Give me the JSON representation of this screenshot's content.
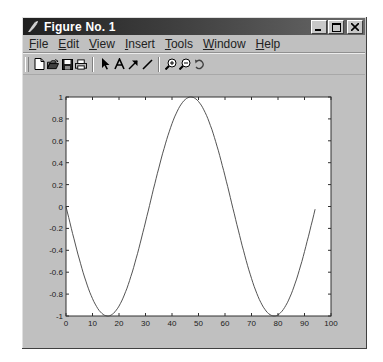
{
  "window": {
    "title": "Figure No. 1",
    "controls": {
      "minimize": "_",
      "maximize": "□",
      "close": "X"
    }
  },
  "menubar": {
    "items": [
      {
        "label": "File",
        "mnemonic": "F"
      },
      {
        "label": "Edit",
        "mnemonic": "E"
      },
      {
        "label": "View",
        "mnemonic": "V"
      },
      {
        "label": "Insert",
        "mnemonic": "I"
      },
      {
        "label": "Tools",
        "mnemonic": "T"
      },
      {
        "label": "Window",
        "mnemonic": "W"
      },
      {
        "label": "Help",
        "mnemonic": "H"
      }
    ]
  },
  "toolbar": {
    "groups": [
      [
        "new-file-icon",
        "open-file-icon",
        "save-icon",
        "print-icon"
      ],
      [
        "select-arrow-icon",
        "insert-text-icon",
        "insert-arrow-icon",
        "insert-line-icon"
      ],
      [
        "zoom-in-icon",
        "zoom-out-icon",
        "rotate-3d-icon"
      ]
    ]
  },
  "colors": {
    "window_bg": "#c0c0c0",
    "plot_bg": "#ffffff",
    "line": "#404040",
    "titlebar": "#2a2a2a"
  },
  "chart_data": {
    "type": "line",
    "title": "",
    "xlabel": "",
    "ylabel": "",
    "xlim": [
      0,
      100
    ],
    "ylim": [
      -1,
      1
    ],
    "xticks": [
      0,
      10,
      20,
      30,
      40,
      50,
      60,
      70,
      80,
      90,
      100
    ],
    "yticks": [
      -1,
      -0.8,
      -0.6,
      -0.4,
      -0.2,
      0,
      0.2,
      0.4,
      0.6,
      0.8,
      1
    ],
    "xtick_labels": [
      "0",
      "10",
      "20",
      "30",
      "40",
      "50",
      "60",
      "70",
      "80",
      "90",
      "100"
    ],
    "ytick_labels": [
      "-1",
      "-0.8",
      "-0.6",
      "-0.4",
      "-0.2",
      "0",
      "0.2",
      "0.4",
      "0.6",
      "0.8",
      "1"
    ],
    "grid": false,
    "legend": null,
    "series": [
      {
        "name": "y = -sin(x/10)",
        "x": [
          0,
          5,
          10,
          15.7,
          20,
          25,
          30,
          35,
          40,
          47.1,
          50,
          55,
          60,
          65,
          70,
          75,
          78.5,
          80,
          85,
          90,
          94.2
        ],
        "y": [
          0,
          -0.48,
          -0.84,
          -1.0,
          -0.91,
          -0.6,
          -0.14,
          0.35,
          0.76,
          1.0,
          0.96,
          0.71,
          0.28,
          -0.22,
          -0.66,
          -0.94,
          -1.0,
          -0.99,
          -0.8,
          -0.41,
          0
        ]
      }
    ]
  }
}
